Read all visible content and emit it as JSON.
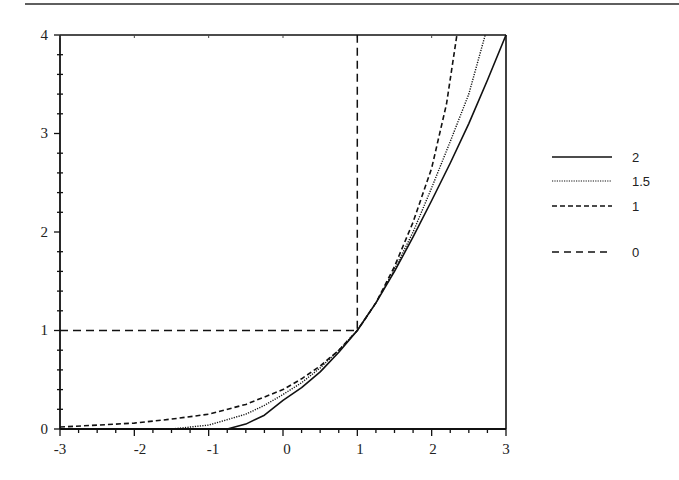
{
  "chart_data": {
    "type": "line",
    "title": "",
    "xlabel": "",
    "ylabel": "",
    "xlim": [
      -3,
      3
    ],
    "ylim": [
      0,
      4
    ],
    "grid": false,
    "legend_position": "right",
    "x_ticks": [
      "-3",
      "-2",
      "-1",
      "0",
      "1",
      "2",
      "3"
    ],
    "y_ticks": [
      "0",
      "1",
      "2",
      "3",
      "4"
    ],
    "y_minor_ticks_per_major": 5,
    "x_minor_ticks_per_major": 4,
    "series": [
      {
        "name": "2",
        "style": "solid",
        "points": [
          [
            -3,
            0
          ],
          [
            -0.75,
            0
          ],
          [
            -0.5,
            0.05
          ],
          [
            -0.25,
            0.14
          ],
          [
            0,
            0.29
          ],
          [
            0.25,
            0.42
          ],
          [
            0.5,
            0.58
          ],
          [
            0.75,
            0.78
          ],
          [
            1,
            1
          ],
          [
            1.25,
            1.28
          ],
          [
            1.5,
            1.6
          ],
          [
            1.75,
            1.95
          ],
          [
            2,
            2.32
          ],
          [
            2.25,
            2.7
          ],
          [
            2.5,
            3.1
          ],
          [
            2.75,
            3.54
          ],
          [
            3,
            4
          ]
        ]
      },
      {
        "name": "1.5",
        "style": "dotted",
        "points": [
          [
            -3,
            0
          ],
          [
            -1.5,
            0
          ],
          [
            -1,
            0.04
          ],
          [
            -0.5,
            0.15
          ],
          [
            -0.25,
            0.24
          ],
          [
            0,
            0.35
          ],
          [
            0.25,
            0.47
          ],
          [
            0.5,
            0.62
          ],
          [
            0.75,
            0.8
          ],
          [
            1,
            1
          ],
          [
            1.25,
            1.28
          ],
          [
            1.5,
            1.62
          ],
          [
            1.75,
            2.0
          ],
          [
            2,
            2.45
          ],
          [
            2.25,
            2.92
          ],
          [
            2.5,
            3.4
          ],
          [
            2.72,
            4
          ]
        ]
      },
      {
        "name": "1",
        "style": "dashed",
        "points": [
          [
            -3,
            0.02
          ],
          [
            -2.5,
            0.04
          ],
          [
            -2,
            0.06
          ],
          [
            -1.5,
            0.1
          ],
          [
            -1,
            0.15
          ],
          [
            -0.5,
            0.25
          ],
          [
            0,
            0.4
          ],
          [
            0.25,
            0.51
          ],
          [
            0.5,
            0.64
          ],
          [
            0.75,
            0.8
          ],
          [
            1,
            1
          ],
          [
            1.25,
            1.28
          ],
          [
            1.5,
            1.65
          ],
          [
            1.75,
            2.1
          ],
          [
            2,
            2.65
          ],
          [
            2.2,
            3.3
          ],
          [
            2.34,
            4
          ]
        ]
      },
      {
        "name": "0",
        "style": "long-dash",
        "points": [
          [
            -3,
            1
          ],
          [
            1,
            1
          ],
          [
            1,
            4
          ]
        ]
      }
    ]
  },
  "legend": {
    "items": [
      {
        "label": "2",
        "style": "solid"
      },
      {
        "label": "1.5",
        "style": "dotted"
      },
      {
        "label": "1",
        "style": "dashed"
      },
      {
        "label": "0",
        "style": "long-dash"
      }
    ]
  },
  "axes": {
    "x_tick_labels": [
      "-3",
      "-2",
      "-1",
      "0",
      "1",
      "2",
      "3"
    ],
    "y_tick_labels": [
      "0",
      "1",
      "2",
      "3",
      "4"
    ]
  },
  "colors": {
    "ink": "#1a1a1a",
    "background": "#ffffff"
  }
}
